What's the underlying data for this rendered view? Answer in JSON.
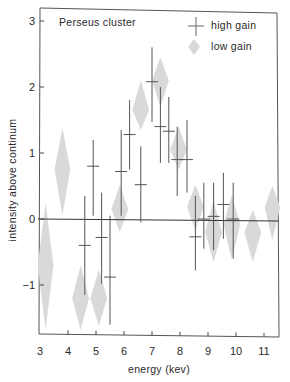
{
  "chart_data": {
    "type": "scatter",
    "title": "",
    "annotation": "Perseus cluster",
    "xlabel": "energy (kev)",
    "ylabel": "intensity above continum",
    "xlim": [
      3,
      11.5
    ],
    "ylim": [
      -1.75,
      3.2
    ],
    "xticks": [
      3,
      4,
      5,
      6,
      7,
      8,
      9,
      10,
      11
    ],
    "yticks": [
      3,
      2,
      1,
      0,
      -1
    ],
    "ytick_labels": [
      "3",
      "2",
      "1",
      "0",
      "-1"
    ],
    "grid": false,
    "zero_line": true,
    "legend": {
      "position": "upper right",
      "entries": [
        {
          "label": "high gain",
          "marker": "cross"
        },
        {
          "label": "low gain",
          "marker": "diamond"
        }
      ]
    },
    "series": [
      {
        "name": "high gain",
        "marker": "cross-with-errorbar",
        "color": "#555555",
        "points": [
          {
            "x": 4.6,
            "y": -0.4,
            "y_hi": 0.35,
            "y_lo": -1.15
          },
          {
            "x": 4.9,
            "y": 0.8,
            "y_hi": 1.2,
            "y_lo": 0.05
          },
          {
            "x": 5.2,
            "y": -0.28,
            "y_hi": 0.4,
            "y_lo": -0.98
          },
          {
            "x": 5.5,
            "y": -0.88,
            "y_hi": 0.05,
            "y_lo": -1.6
          },
          {
            "x": 5.9,
            "y": 0.72,
            "y_hi": 1.35,
            "y_lo": 0.05
          },
          {
            "x": 6.2,
            "y": 1.28,
            "y_hi": 1.8,
            "y_lo": 0.75
          },
          {
            "x": 6.6,
            "y": 0.52,
            "y_hi": 1.1,
            "y_lo": -0.05
          },
          {
            "x": 7.0,
            "y": 2.08,
            "y_hi": 2.6,
            "y_lo": 1.47
          },
          {
            "x": 7.3,
            "y": 1.4,
            "y_hi": 2.0,
            "y_lo": 0.85
          },
          {
            "x": 7.6,
            "y": 1.33,
            "y_hi": 1.85,
            "y_lo": 0.85
          },
          {
            "x": 7.9,
            "y": 0.9,
            "y_hi": 1.4,
            "y_lo": 0.35
          },
          {
            "x": 8.25,
            "y": 0.9,
            "y_hi": 1.5,
            "y_lo": 0.4
          },
          {
            "x": 8.55,
            "y": -0.27,
            "y_hi": 0.35,
            "y_lo": -0.78
          },
          {
            "x": 8.85,
            "y": 0.0,
            "y_hi": 0.55,
            "y_lo": -0.45
          },
          {
            "x": 9.2,
            "y": 0.04,
            "y_hi": 0.55,
            "y_lo": -0.47
          },
          {
            "x": 9.55,
            "y": 0.22,
            "y_hi": 0.7,
            "y_lo": -0.3
          },
          {
            "x": 9.9,
            "y": 0.0,
            "y_hi": 0.55,
            "y_lo": -0.6
          }
        ]
      },
      {
        "name": "low gain",
        "marker": "diamond",
        "color": "#d9d9d9",
        "points": [
          {
            "x": 3.2,
            "y": -0.7,
            "y_hi": 0.25,
            "y_lo": -1.68,
            "half_width_kev": 0.28
          },
          {
            "x": 3.8,
            "y": 0.75,
            "y_hi": 1.38,
            "y_lo": 0.06,
            "half_width_kev": 0.28
          },
          {
            "x": 4.45,
            "y": -1.2,
            "y_hi": -0.7,
            "y_lo": -1.68,
            "half_width_kev": 0.3
          },
          {
            "x": 5.1,
            "y": -1.2,
            "y_hi": -0.77,
            "y_lo": -1.62,
            "half_width_kev": 0.3
          },
          {
            "x": 5.85,
            "y": 0.15,
            "y_hi": 0.52,
            "y_lo": -0.2,
            "half_width_kev": 0.3
          },
          {
            "x": 6.6,
            "y": 1.65,
            "y_hi": 2.1,
            "y_lo": 1.35,
            "half_width_kev": 0.3
          },
          {
            "x": 7.3,
            "y": 2.1,
            "y_hi": 2.45,
            "y_lo": 1.7,
            "half_width_kev": 0.3
          },
          {
            "x": 7.95,
            "y": 1.05,
            "y_hi": 1.4,
            "y_lo": 0.75,
            "half_width_kev": 0.3
          },
          {
            "x": 8.55,
            "y": 0.18,
            "y_hi": 0.52,
            "y_lo": -0.17,
            "half_width_kev": 0.3
          },
          {
            "x": 9.2,
            "y": -0.2,
            "y_hi": 0.28,
            "y_lo": -0.65,
            "half_width_kev": 0.3
          },
          {
            "x": 9.85,
            "y": -0.08,
            "y_hi": 0.36,
            "y_lo": -0.62,
            "half_width_kev": 0.3
          },
          {
            "x": 10.6,
            "y": -0.2,
            "y_hi": 0.14,
            "y_lo": -0.65,
            "half_width_kev": 0.3
          },
          {
            "x": 11.3,
            "y": 0.18,
            "y_hi": 0.5,
            "y_lo": -0.32,
            "half_width_kev": 0.28
          }
        ]
      }
    ]
  },
  "layout": {
    "plot": {
      "left": 40,
      "right": 279,
      "top": 8,
      "bottom": 334
    },
    "x_px_per_unit": 28.0,
    "x_origin_px": 40,
    "y_px_per_unit": 66.0,
    "y_zero_px": 219
  }
}
